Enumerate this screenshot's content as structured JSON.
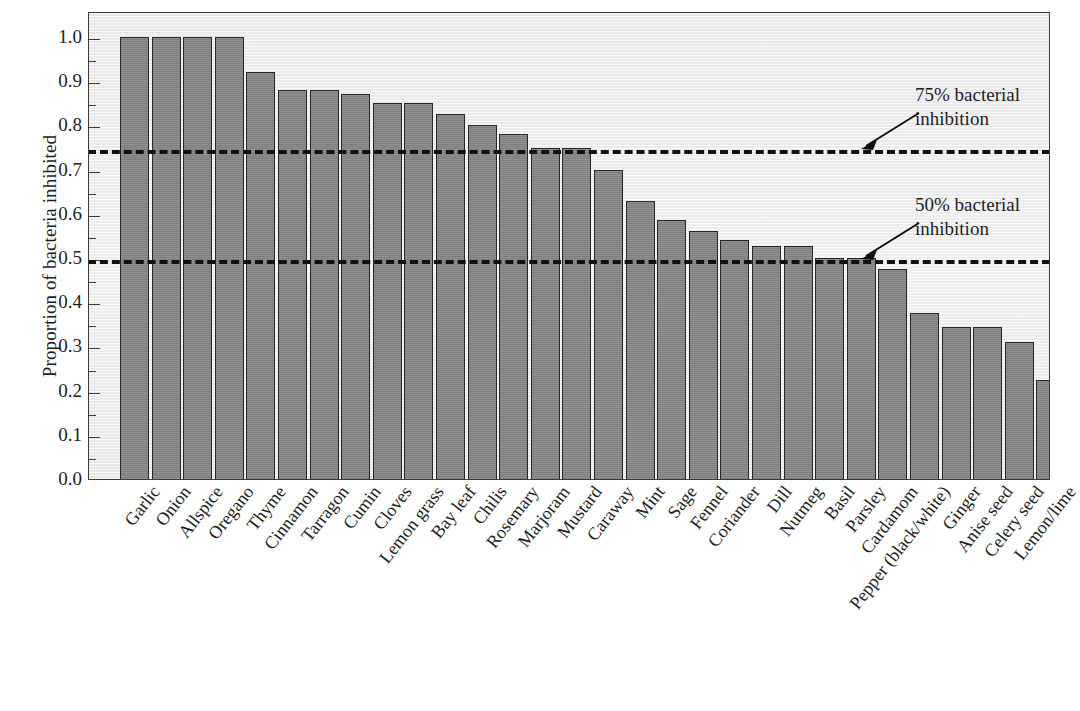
{
  "chart_data": {
    "type": "bar",
    "title": "",
    "xlabel": "",
    "ylabel": "Proportion of bacteria inhibited",
    "ylim": [
      0.0,
      1.0
    ],
    "ytick_labels": [
      "1.0",
      "0.9",
      "0.8",
      "0.7",
      "0.6",
      "0.5",
      "0.4",
      "0.3",
      "0.2",
      "0.1",
      "0.0"
    ],
    "ytick_values": [
      1.0,
      0.9,
      0.8,
      0.7,
      0.6,
      0.5,
      0.4,
      0.3,
      0.2,
      0.1,
      0.0
    ],
    "minor_tick_step": 0.05,
    "grid": false,
    "legend": "none",
    "bar_color": "#848484",
    "bar_edge_color": "#262626",
    "plot_background": "#efefef",
    "categories": [
      "Garlic",
      "Onion",
      "Allspice",
      "Oregano",
      "Thyme",
      "Cinnamon",
      "Tarragon",
      "Cumin",
      "Cloves",
      "Lemon grass",
      "Bay leaf",
      "Chilis",
      "Rosemary",
      "Marjoram",
      "Mustard",
      "Caraway",
      "Mint",
      "Sage",
      "Fennel",
      "Coriander",
      "Dill",
      "Nutmeg",
      "Basil",
      "Parsley",
      "Cardamom",
      "Pepper (black/white)",
      "Ginger",
      "Anise seed",
      "Celery seed",
      "Lemon/lime"
    ],
    "values": [
      1.0,
      1.0,
      1.0,
      1.0,
      0.92,
      0.88,
      0.88,
      0.87,
      0.85,
      0.85,
      0.825,
      0.8,
      0.78,
      0.75,
      0.75,
      0.7,
      0.628,
      0.585,
      0.56,
      0.54,
      0.528,
      0.528,
      0.5,
      0.5,
      0.475,
      0.375,
      0.345,
      0.345,
      0.31,
      0.225
    ],
    "reference_lines": [
      {
        "value": 0.75,
        "label_line1": "75% bacterial",
        "label_line2": "inhibition",
        "style": "dashed",
        "color": "#111111"
      },
      {
        "value": 0.5,
        "label_line1": "50% bacterial",
        "label_line2": "inhibition",
        "style": "dashed",
        "color": "#111111"
      }
    ]
  }
}
